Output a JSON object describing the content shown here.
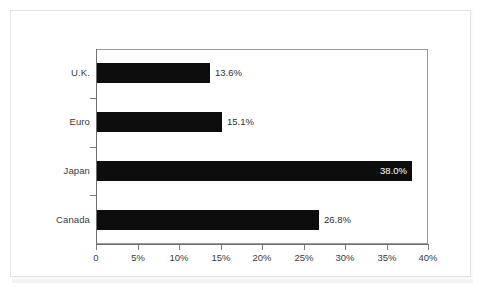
{
  "chart_data": {
    "type": "bar",
    "orientation": "horizontal",
    "title": "",
    "subtitle": "",
    "xlabel": "",
    "ylabel": "",
    "categories": [
      "U.K.",
      "Euro",
      "Japan",
      "Canada"
    ],
    "values": [
      13.6,
      15.1,
      38.0,
      26.8
    ],
    "data_labels": [
      "13.6%",
      "15.1%",
      "38.0%",
      "26.8%"
    ],
    "label_placement": [
      "outside",
      "outside",
      "inside",
      "outside"
    ],
    "xlim": [
      0,
      40
    ],
    "xticks": [
      0,
      5,
      10,
      15,
      20,
      25,
      30,
      35,
      40
    ],
    "xtick_labels": [
      "0",
      "5%",
      "10%",
      "15%",
      "20%",
      "25%",
      "30%",
      "35%",
      "40%"
    ],
    "grid": false,
    "legend": null,
    "bar_color": "#0d0d0d",
    "plot_background": "#ffffff",
    "axis_color": "#6e6e6e",
    "text_color": "#3b3b3b",
    "inside_label_color": "#ffffff"
  },
  "card": {
    "background": "#ffffff",
    "border_color": "#e3e3e3"
  }
}
